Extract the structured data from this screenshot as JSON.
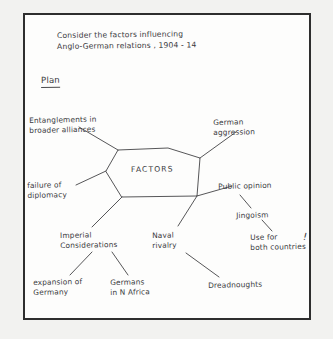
{
  "page": {
    "title_line1": "Consider the factors influencing",
    "title_line2": "Anglo-German relations , 1904 - 14",
    "section_heading": "Plan"
  },
  "diagram": {
    "type": "mind-map",
    "center_node": "FACTORS",
    "center_shape": "hexagon",
    "branches": [
      {
        "id": "entanglements",
        "label": "Entanglements in\nbroader alliances",
        "position": "upper-left",
        "children": []
      },
      {
        "id": "german-aggression",
        "label": "German\naggression",
        "position": "upper-right",
        "children": []
      },
      {
        "id": "failure-of-diplomacy",
        "label": "failure of\ndiplomacy",
        "position": "left",
        "children": []
      },
      {
        "id": "public-opinion",
        "label": "Public opinion",
        "position": "right",
        "children": [
          {
            "id": "jingoism",
            "label": "Jingoism",
            "children": [
              {
                "id": "use-for-both-countries",
                "label": "Use for\nboth countries",
                "annotation": "!"
              }
            ]
          }
        ]
      },
      {
        "id": "imperial-considerations",
        "label": "Imperial\nConsiderations",
        "position": "lower-left",
        "children": [
          {
            "id": "expansion-of-germany",
            "label": "expansion of\nGermany"
          },
          {
            "id": "germans-in-n-africa",
            "label": "Germans\nin N Africa"
          }
        ]
      },
      {
        "id": "naval-rivalry",
        "label": "Naval\nrivalry",
        "position": "lower-right",
        "children": [
          {
            "id": "dreadnoughts",
            "label": "Dreadnoughts"
          }
        ]
      }
    ]
  },
  "colors": {
    "ink": "#3a3a3c",
    "paper": "#fdfdfc",
    "backdrop": "#f2f2f0",
    "border": "#2e2e2e"
  }
}
